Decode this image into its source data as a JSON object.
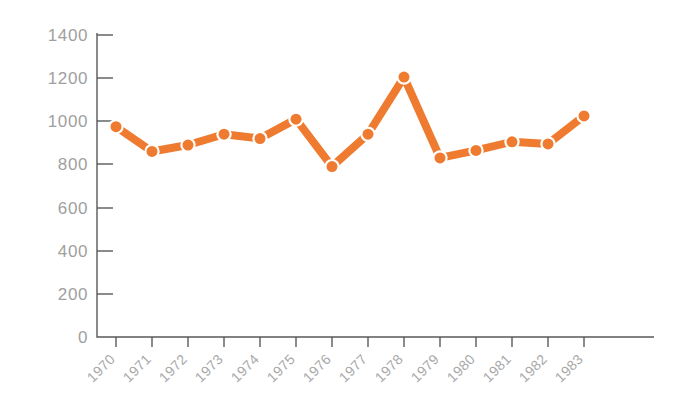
{
  "chart_data": {
    "type": "line",
    "title": "",
    "subtitle": "",
    "xlabel": "",
    "ylabel": "",
    "categories": [
      "1970",
      "1971",
      "1972",
      "1973",
      "1974",
      "1975",
      "1976",
      "1977",
      "1978",
      "1979",
      "1980",
      "1981",
      "1982",
      "1983"
    ],
    "values": [
      975,
      860,
      890,
      940,
      920,
      1010,
      790,
      940,
      1205,
      830,
      865,
      905,
      895,
      1025
    ],
    "series": [
      {
        "name": "series-1",
        "color": "#ee7b30",
        "values": [
          975,
          860,
          890,
          940,
          920,
          1010,
          790,
          940,
          1205,
          830,
          865,
          905,
          895,
          1025
        ]
      }
    ],
    "ylim": [
      0,
      1400
    ],
    "y_ticks": [
      0,
      200,
      400,
      600,
      800,
      1000,
      1200,
      1400
    ],
    "y_tick_labels": [
      "0",
      "200",
      "400",
      "600",
      "800",
      "1000",
      "1200",
      "1400"
    ],
    "x_tick_labels": [
      "1970",
      "1971",
      "1972",
      "1973",
      "1974",
      "1975",
      "1976",
      "1977",
      "1978",
      "1979",
      "1980",
      "1981",
      "1982",
      "1983"
    ],
    "x_tick_label_rotation": -45,
    "grid": false,
    "legend": false,
    "legend_position": "none",
    "marker": "circle",
    "annotations": []
  },
  "style": {
    "accent_color": "#ee7b30",
    "marker_fill_color": "#f4a26a",
    "axis_color": "#58595b",
    "tick_label_color": "#a0a0a0",
    "background_color": "#ffffff",
    "line_width": 8,
    "marker_radius": 5.5
  },
  "geometry": {
    "plot_left": 116,
    "plot_right": 644,
    "plot_top": 35,
    "plot_bottom": 337,
    "axis_x": 97,
    "x_step": 36
  }
}
